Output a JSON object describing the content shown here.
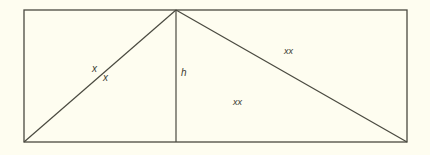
{
  "diagram": {
    "background": "#fefdf0",
    "stroke_color": "#4a4a40",
    "rectangle": {
      "x1": 24,
      "y1": 10,
      "x2": 407,
      "y2": 142
    },
    "apex": {
      "x": 176,
      "y": 10
    },
    "labels": {
      "left_side_upper": "x",
      "left_side_lower": "x",
      "height": "h",
      "right_side": "xx",
      "right_region": "xx"
    }
  }
}
